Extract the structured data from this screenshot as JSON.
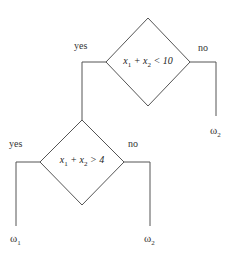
{
  "diagram": {
    "type": "decision-tree",
    "nodes": {
      "root": {
        "var1": "x",
        "sub1": "1",
        "op": " + ",
        "var2": "x",
        "sub2": "2",
        "cmp": " < 10"
      },
      "child": {
        "var1": "x",
        "sub1": "1",
        "op": " + ",
        "var2": "x",
        "sub2": "2",
        "cmp": " > 4"
      }
    },
    "edges": {
      "root_yes": "yes",
      "root_no": "no",
      "child_yes": "yes",
      "child_no": "no"
    },
    "leaves": {
      "root_no": {
        "symbol": "ω",
        "sub": "2"
      },
      "child_yes": {
        "symbol": "ω",
        "sub": "1"
      },
      "child_no": {
        "symbol": "ω",
        "sub": "2"
      }
    },
    "colors": {
      "line": "#555555",
      "text": "#333333",
      "background": "#ffffff"
    }
  }
}
